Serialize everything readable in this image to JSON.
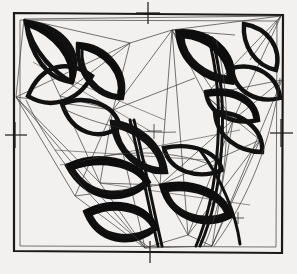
{
  "artwork": {
    "title": "Hand-drawn geometric lens composition",
    "medium": "ink sketch",
    "canvas": {
      "width": 297,
      "height": 274
    },
    "background_color": "#f2f1ef",
    "ink_color": "#111111",
    "construction_line_color": "#3a3a3a"
  },
  "frame": {
    "label": "square border frame",
    "x": 13,
    "y": 13,
    "width": 270,
    "height": 240,
    "stroke_color": "#1a1a1a",
    "stroke_width": 2.2
  },
  "registration_marks": [
    {
      "name": "top-center",
      "x": 148,
      "y": 10,
      "orientation": "cross"
    },
    {
      "name": "left-middle",
      "x": 15,
      "y": 135,
      "orientation": "cross"
    },
    {
      "name": "right-middle",
      "x": 281,
      "y": 133,
      "orientation": "cross"
    },
    {
      "name": "bottom-center",
      "x": 150,
      "y": 252,
      "orientation": "cross"
    },
    {
      "name": "interior-center",
      "x": 154,
      "y": 131,
      "orientation": "small-cross"
    },
    {
      "name": "interior-lower",
      "x": 146,
      "y": 186,
      "orientation": "small-cross"
    },
    {
      "name": "interior-right",
      "x": 238,
      "y": 218,
      "orientation": "small-cross"
    }
  ],
  "shape_clusters": [
    {
      "name": "upper-left-cluster",
      "count": 4,
      "region": "top-left quadrant"
    },
    {
      "name": "upper-right-cluster",
      "count": 5,
      "region": "top-right quadrant"
    },
    {
      "name": "center-cluster",
      "count": 3,
      "region": "center"
    },
    {
      "name": "lower-center-cluster",
      "count": 4,
      "region": "bottom-center"
    },
    {
      "name": "right-cluster",
      "count": 3,
      "region": "mid-right"
    }
  ],
  "counts": {
    "lens_shapes": 19,
    "construction_lines": 46,
    "registration_marks": 7
  }
}
